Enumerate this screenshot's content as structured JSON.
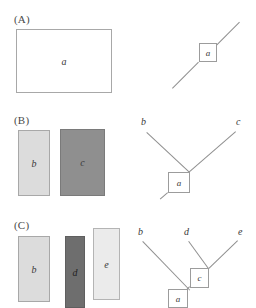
{
  "figure": {
    "background_color": "#ffffff",
    "width": 256,
    "height": 308
  },
  "panels": [
    {
      "id": "A",
      "label": "(A)",
      "rectangles": [
        {
          "name": "a",
          "label": "a",
          "fill": "#ffffff",
          "stroke": "#a8a8a8",
          "x": 16,
          "y": 29,
          "w": 96,
          "h": 64
        }
      ],
      "tree": {
        "nodes": [
          {
            "name": "a",
            "label": "a",
            "x": 199,
            "y": 43,
            "w": 18,
            "h": 19
          }
        ],
        "tips": [],
        "edges": [
          {
            "from": "lower-left-stub",
            "to": "node-a"
          },
          {
            "from": "node-a",
            "to": "upper-right-stub"
          }
        ]
      }
    },
    {
      "id": "B",
      "label": "(B)",
      "rectangles": [
        {
          "name": "b",
          "label": "b",
          "fill": "#dcdcdc",
          "stroke": "#a8a8a8",
          "x": 18,
          "y": 130,
          "w": 32,
          "h": 66
        },
        {
          "name": "c",
          "label": "c",
          "fill": "#8f8f8f",
          "stroke": "#7a7a7a",
          "x": 60,
          "y": 129,
          "w": 45,
          "h": 67
        }
      ],
      "tree": {
        "nodes": [
          {
            "name": "a",
            "label": "a",
            "x": 168,
            "y": 172,
            "w": 22,
            "h": 21
          }
        ],
        "tips": [
          {
            "name": "b",
            "label": "b",
            "x": 141,
            "y": 118
          },
          {
            "name": "c",
            "label": "c",
            "x": 236,
            "y": 118
          }
        ],
        "edges": [
          {
            "from": "tip-b",
            "to": "junction-a"
          },
          {
            "from": "tip-c",
            "to": "junction-a"
          },
          {
            "from": "node-a",
            "to": "root-stub"
          }
        ]
      }
    },
    {
      "id": "C",
      "label": "(C)",
      "rectangles": [
        {
          "name": "b",
          "label": "b",
          "fill": "#dcdcdc",
          "stroke": "#a8a8a8",
          "x": 18,
          "y": 236,
          "w": 32,
          "h": 66
        },
        {
          "name": "d",
          "label": "d",
          "fill": "#6e6e6e",
          "stroke": "#5f5f5f",
          "x": 65,
          "y": 236,
          "w": 20,
          "h": 72
        },
        {
          "name": "e",
          "label": "e",
          "fill": "#ebebeb",
          "stroke": "#b4b4b4",
          "x": 93,
          "y": 228,
          "w": 27,
          "h": 72
        }
      ],
      "tree": {
        "nodes": [
          {
            "name": "c",
            "label": "c",
            "x": 190,
            "y": 268,
            "w": 19,
            "h": 20
          },
          {
            "name": "a",
            "label": "a",
            "x": 168,
            "y": 289,
            "w": 20,
            "h": 19
          }
        ],
        "tips": [
          {
            "name": "b",
            "label": "b",
            "x": 138,
            "y": 228
          },
          {
            "name": "d",
            "label": "d",
            "x": 184,
            "y": 228
          },
          {
            "name": "e",
            "label": "e",
            "x": 238,
            "y": 228
          }
        ],
        "edges": [
          {
            "from": "tip-b",
            "to": "junction-a"
          },
          {
            "from": "tip-d",
            "to": "junction-c"
          },
          {
            "from": "tip-e",
            "to": "junction-c"
          },
          {
            "from": "node-c",
            "to": "node-a"
          }
        ]
      }
    }
  ]
}
